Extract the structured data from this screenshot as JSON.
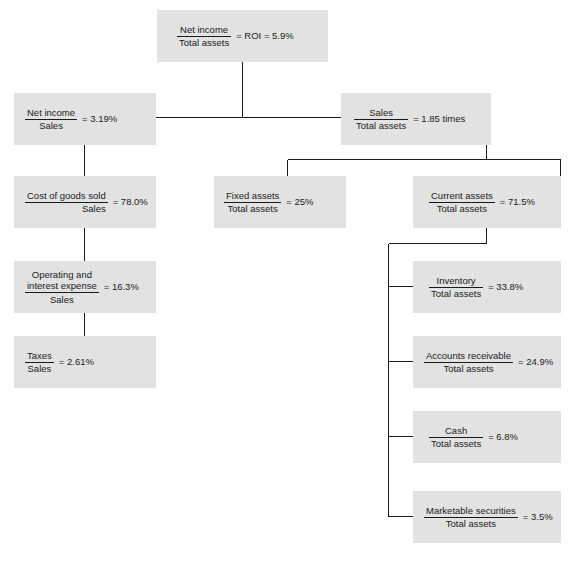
{
  "diagram": {
    "box_fill": "#e2e2e2",
    "line_color": "#1a1a1a",
    "background": "#ffffff",
    "nodes": [
      {
        "id": "roi",
        "numerator": "Net income",
        "denominator": "Total assets",
        "result": "= ROI = 5.9%"
      },
      {
        "id": "net-income-sales",
        "numerator": "Net income",
        "denominator": "Sales",
        "result": "= 3.19%"
      },
      {
        "id": "sales-total-assets",
        "numerator": "Sales",
        "denominator": "Total assets",
        "result": "= 1.85 times"
      },
      {
        "id": "cost-of-goods-sold",
        "numerator": "Cost of goods sold",
        "denominator": "Sales",
        "result": "= 78.0%"
      },
      {
        "id": "operating-interest-expense",
        "numerator_line1": "Operating and",
        "numerator_line2": "interest expense",
        "denominator": "Sales",
        "result": "= 16.3%"
      },
      {
        "id": "taxes-sales",
        "numerator": "Taxes",
        "denominator": "Sales",
        "result": "= 2.61%"
      },
      {
        "id": "fixed-assets",
        "numerator": "Fixed assets",
        "denominator": "Total assets",
        "result": "= 25%"
      },
      {
        "id": "current-assets",
        "numerator": "Current assets",
        "denominator": "Total assets",
        "result": "= 71.5%"
      },
      {
        "id": "inventory",
        "numerator": "Inventory",
        "denominator": "Total assets",
        "result": "= 33.8%"
      },
      {
        "id": "accounts-receivable",
        "numerator": "Accounts receivable",
        "denominator": "Total assets",
        "result": "= 24.9%"
      },
      {
        "id": "cash",
        "numerator": "Cash",
        "denominator": "Total assets",
        "result": "= 6.8%"
      },
      {
        "id": "marketable-securities",
        "numerator": "Marketable securities",
        "denominator": "Total assets",
        "result": "= 3.5%"
      }
    ]
  }
}
